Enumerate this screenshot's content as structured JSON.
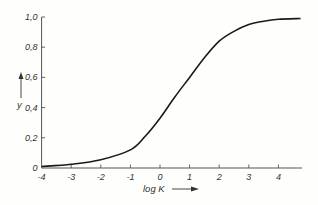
{
  "chart_data": {
    "type": "line",
    "title": "",
    "xlabel": "log K",
    "ylabel": "y",
    "xlim": [
      -4,
      4.75
    ],
    "ylim": [
      0,
      1.0
    ],
    "grid": false,
    "legend": null,
    "x_ticks": [
      -4,
      -3,
      -2,
      -1,
      0,
      1,
      2,
      3,
      4
    ],
    "x_tick_labels": [
      "-4",
      "-3",
      "-2",
      "-1",
      "0",
      "1",
      "2",
      "3",
      "4"
    ],
    "y_ticks": [
      0,
      0.2,
      0.4,
      0.6,
      0.8,
      1.0
    ],
    "y_tick_labels": [
      "0",
      "0,2",
      "0,4",
      "0,6",
      "0,8",
      "1,0"
    ],
    "series": [
      {
        "name": "y vs log K",
        "x": [
          -4,
          -3,
          -2,
          -1,
          -0.5,
          0,
          0.5,
          1,
          1.5,
          2,
          2.5,
          3,
          3.5,
          4,
          4.75
        ],
        "y": [
          0.01,
          0.025,
          0.055,
          0.12,
          0.21,
          0.33,
          0.47,
          0.6,
          0.73,
          0.84,
          0.905,
          0.95,
          0.972,
          0.985,
          0.99
        ]
      }
    ]
  },
  "colors": {
    "line": "#1a1a1a",
    "axis": "#555555",
    "background": "#fefefc"
  }
}
